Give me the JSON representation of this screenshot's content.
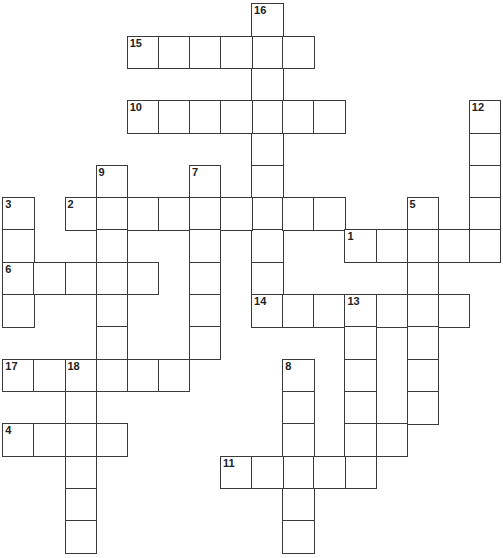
{
  "puzzle": {
    "type": "crossword",
    "grid": {
      "origin_x": 3,
      "origin_y": 4,
      "cell_w": 31.1,
      "cell_h": 32.3
    },
    "line_color": "#3a3a3a",
    "entries": [
      {
        "number": "16",
        "direction": "down",
        "row": 0,
        "col": 8,
        "length": 10
      },
      {
        "number": "15",
        "direction": "across",
        "row": 1,
        "col": 4,
        "length": 6
      },
      {
        "number": "10",
        "direction": "across",
        "row": 3,
        "col": 4,
        "length": 7
      },
      {
        "number": "12",
        "direction": "down",
        "row": 3,
        "col": 15,
        "length": 5
      },
      {
        "number": "9",
        "direction": "down",
        "row": 5,
        "col": 3,
        "length": 7
      },
      {
        "number": "7",
        "direction": "down",
        "row": 5,
        "col": 6,
        "length": 6
      },
      {
        "number": "3",
        "direction": "down",
        "row": 6,
        "col": 0,
        "length": 4
      },
      {
        "number": "2",
        "direction": "across",
        "row": 6,
        "col": 2,
        "length": 9
      },
      {
        "number": "5",
        "direction": "down",
        "row": 6,
        "col": 13,
        "length": 7
      },
      {
        "number": "1",
        "direction": "across",
        "row": 7,
        "col": 11,
        "length": 5
      },
      {
        "number": "6",
        "direction": "across",
        "row": 8,
        "col": 0,
        "length": 5
      },
      {
        "number": "14",
        "direction": "across",
        "row": 9,
        "col": 8,
        "length": 7
      },
      {
        "number": "13",
        "direction": "down",
        "row": 9,
        "col": 11,
        "length": 6
      },
      {
        "number": "17",
        "direction": "across",
        "row": 11,
        "col": 0,
        "length": 6
      },
      {
        "number": "8",
        "direction": "down",
        "row": 11,
        "col": 9,
        "length": 6
      },
      {
        "number": "18",
        "direction": "down",
        "row": 11,
        "col": 2,
        "length": 6
      },
      {
        "number": "4",
        "direction": "across",
        "row": 13,
        "col": 0,
        "length": 4
      },
      {
        "number": "",
        "direction": "across",
        "row": 13,
        "col": 11,
        "length": 2
      },
      {
        "number": "11",
        "direction": "across",
        "row": 14,
        "col": 7,
        "length": 5
      }
    ]
  }
}
